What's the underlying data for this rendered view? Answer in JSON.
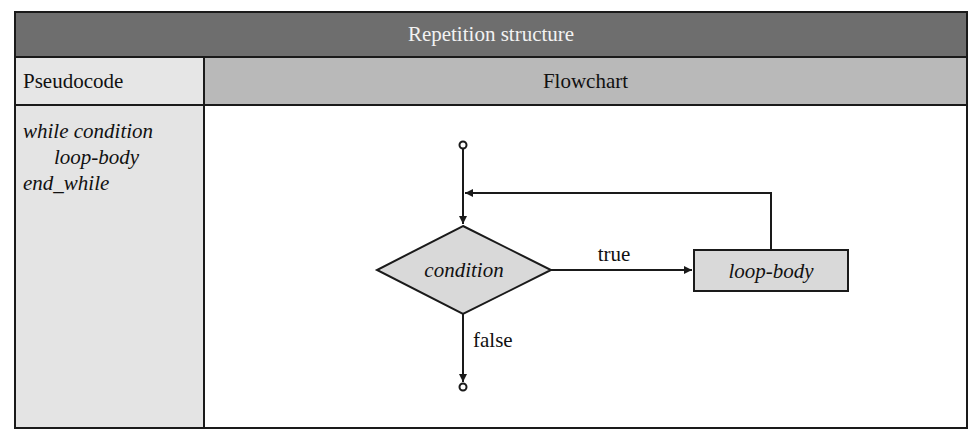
{
  "table": {
    "title": "Repetition structure",
    "columns": [
      "Pseudocode",
      "Flowchart"
    ]
  },
  "pseudocode": {
    "lines": [
      "while condition",
      "loop-body",
      "end_while"
    ]
  },
  "flowchart": {
    "decision_label": "condition",
    "process_label": "loop-body",
    "true_label": "true",
    "false_label": "false",
    "colors": {
      "shape_fill": "#d9d9d9",
      "stroke": "#1a1a1a"
    }
  }
}
